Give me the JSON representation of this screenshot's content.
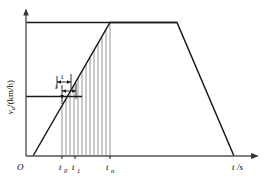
{
  "figure": {
    "name": "velocity-time-diagram",
    "background_color": "#ffffff",
    "line_color": "#1a1a1a",
    "hatch_color": "#6e6e6e"
  },
  "axes": {
    "origin_label": "O",
    "y_axis": {
      "name": "y-axis",
      "label_var": "v",
      "label_sub": "a",
      "label_unit": "/(km/h)",
      "label_full": "v_a/(km/h)"
    },
    "x_axis": {
      "name": "x-axis",
      "label_var": "t",
      "label_unit": "/s",
      "label_full": "t/s"
    }
  },
  "ticks": {
    "x": [
      {
        "name": "tick-t0",
        "var": "t",
        "sub": "0",
        "label": "t0",
        "px": 62
      },
      {
        "name": "tick-t1",
        "var": "t",
        "sub": "1",
        "label": "t1",
        "px": 75
      },
      {
        "name": "tick-tn",
        "var": "t",
        "sub": "n",
        "label": "tn",
        "px": 110
      }
    ]
  },
  "annotations": [
    {
      "name": "interval-annotation-upper",
      "label": "1"
    },
    {
      "name": "interval-annotation-lower",
      "label": "1"
    }
  ],
  "chart_data": {
    "type": "line",
    "title": "",
    "xlabel": "t/s",
    "ylabel": "v_a/(km/h)",
    "grid": false,
    "legend": "none",
    "xlim": [
      0,
      260
    ],
    "ylim": [
      0,
      100
    ],
    "series": [
      {
        "name": "speed-profile",
        "comment": "Piecewise velocity vs time: idle offset, linear acceleration, constant max speed plateau, linear deceleration to zero",
        "x": [
          33,
          110,
          177,
          234
        ],
        "y": [
          0,
          100,
          100,
          0
        ],
        "points": [
          {
            "label": "start-of-acceleration",
            "x": 33,
            "y": 0
          },
          {
            "label": "top-of-acceleration-tn",
            "x": 110,
            "y": 100
          },
          {
            "label": "end-of-plateau",
            "x": 177,
            "y": 100
          },
          {
            "label": "stop",
            "x": 234,
            "y": 0
          }
        ]
      }
    ],
    "reference_lines": [
      {
        "name": "v-max-horizontal",
        "orientation": "horizontal",
        "y": 100,
        "from_x": 26,
        "to_x": 177
      },
      {
        "name": "v0-horizontal",
        "orientation": "horizontal",
        "y": 53,
        "from_x": 26,
        "to_x": 82
      }
    ],
    "integration_strips": {
      "name": "riemann-strips",
      "comment": "Vertical hatch lines from x-axis up to the acceleration line between t0 and tn",
      "from_x": 62,
      "to_x": 110,
      "count": 12
    }
  }
}
